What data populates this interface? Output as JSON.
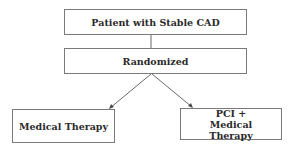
{
  "diagram": {
    "type": "flowchart",
    "nodes": [
      {
        "id": "patient",
        "label": "Patient with Stable CAD"
      },
      {
        "id": "randomized",
        "label": "Randomized"
      },
      {
        "id": "medical",
        "label": "Medical Therapy"
      },
      {
        "id": "pci",
        "label": "PCI + Medical Therapy"
      }
    ],
    "edges": [
      {
        "from": "patient",
        "to": "randomized",
        "arrow": false
      },
      {
        "from": "randomized",
        "to": "medical",
        "arrow": true
      },
      {
        "from": "randomized",
        "to": "pci",
        "arrow": true
      }
    ],
    "colors": {
      "border": "#7a7a7a",
      "line": "#6a6a6a",
      "text": "#2a2a2a"
    }
  }
}
